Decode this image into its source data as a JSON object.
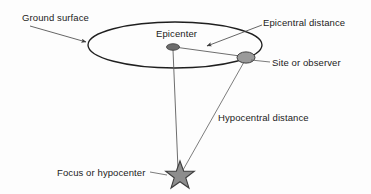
{
  "diagram": {
    "labels": {
      "ground_surface": "Ground surface",
      "epicenter": "Epicenter",
      "epicentral_distance": "Epicentral distance",
      "site_or_observer": "Site or observer",
      "hypocentral_distance": "Hypocentral distance",
      "focus_or_hypocenter": "Focus or hypocenter"
    },
    "colors": {
      "background": "#fdfdfd",
      "stroke": "#1f1f1f",
      "text": "#222222",
      "marker_fill": "#8c8c8c",
      "epicenter_fill": "#6b6b6b",
      "leader_line": "#5a5a5a",
      "distance_line": "#6e6e6e"
    },
    "shapes": {
      "ground_plane": {
        "type": "ellipse",
        "cx": 175,
        "cy": 45,
        "rx": 87,
        "ry": 23
      },
      "epicenter_marker": {
        "type": "ellipse",
        "cx": 173,
        "cy": 47,
        "rx": 6.5,
        "ry": 3.2
      },
      "site_marker": {
        "type": "ellipse",
        "cx": 246,
        "cy": 57,
        "rx": 9,
        "ry": 5.5
      },
      "hypocenter_star": {
        "type": "star",
        "cx": 180,
        "cy": 176,
        "outer_radius": 15,
        "inner_radius": 6.3,
        "points": 5
      },
      "depth_line": {
        "type": "line",
        "x1": 173,
        "y1": 50,
        "x2": 178,
        "y2": 168
      },
      "hypocentral_line": {
        "type": "line",
        "x1": 244,
        "y1": 62,
        "x2": 182,
        "y2": 170
      },
      "epicentral_line": {
        "type": "line",
        "x1": 178,
        "y1": 47,
        "x2": 240,
        "y2": 56
      }
    },
    "leaders": [
      {
        "name": "ground-surface-leader",
        "from": [
          30,
          26
        ],
        "to": [
          88,
          43
        ],
        "arrow": true
      },
      {
        "name": "epicentral-distance-leader",
        "from": [
          262,
          25
        ],
        "to": [
          205,
          47
        ],
        "arrow": true
      },
      {
        "name": "site-leader",
        "from": [
          270,
          62
        ],
        "to": [
          250,
          60
        ],
        "arrow": false
      },
      {
        "name": "focus-leader",
        "from": [
          152,
          172
        ],
        "to": [
          168,
          176
        ],
        "arrow": false
      }
    ]
  }
}
